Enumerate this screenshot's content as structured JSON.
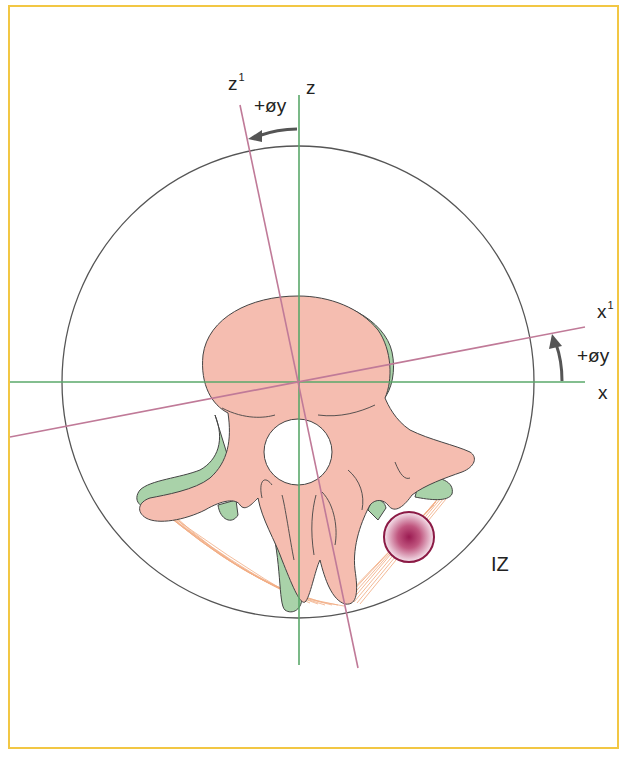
{
  "figure": {
    "type": "vertebra-axial-rotation-diagram",
    "frame_color": "#f2c744",
    "colors": {
      "axis_original": "#5aa86a",
      "axis_rotated": "#c07a98",
      "bone_fill": "#f5bdb0",
      "cartilage_fill": "#a9d2a9",
      "outline": "#444444",
      "ligament": "#f0a070",
      "lesion": "#9b1b52",
      "circle_outline": "#555555"
    }
  },
  "labels": {
    "z_axis": "z",
    "z_rotated_base": "z",
    "z_rotated_sup": "1",
    "z_rotation": "+øy",
    "x_axis": "x",
    "x_rotated_base": "x",
    "x_rotated_sup": "1",
    "x_rotation": "+øy",
    "zone": "IZ"
  }
}
